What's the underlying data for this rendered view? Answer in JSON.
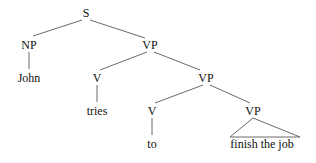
{
  "diagram": {
    "type": "syntax-tree",
    "nodes": {
      "s": {
        "label": "S",
        "x": 86,
        "y": 17
      },
      "np": {
        "label": "NP",
        "x": 29,
        "y": 49
      },
      "vp1": {
        "label": "VP",
        "x": 150,
        "y": 49
      },
      "john": {
        "label": "John",
        "x": 29,
        "y": 82
      },
      "v1": {
        "label": "V",
        "x": 97,
        "y": 82
      },
      "vp2": {
        "label": "VP",
        "x": 206,
        "y": 82
      },
      "tries": {
        "label": "tries",
        "x": 97,
        "y": 115
      },
      "v2": {
        "label": "V",
        "x": 152,
        "y": 115
      },
      "vp3": {
        "label": "VP",
        "x": 253,
        "y": 115
      },
      "to": {
        "label": "to",
        "x": 152,
        "y": 147
      },
      "finish": {
        "label": "finish the job",
        "x": 258,
        "y": 147
      }
    },
    "edges": [
      [
        "s",
        "np"
      ],
      [
        "s",
        "vp1"
      ],
      [
        "np",
        "john"
      ],
      [
        "vp1",
        "v1"
      ],
      [
        "vp1",
        "vp2"
      ],
      [
        "v1",
        "tries"
      ],
      [
        "vp2",
        "v2"
      ],
      [
        "vp2",
        "vp3"
      ],
      [
        "v2",
        "to"
      ]
    ],
    "triangle": {
      "apex": "vp3",
      "covers": "finish"
    }
  }
}
